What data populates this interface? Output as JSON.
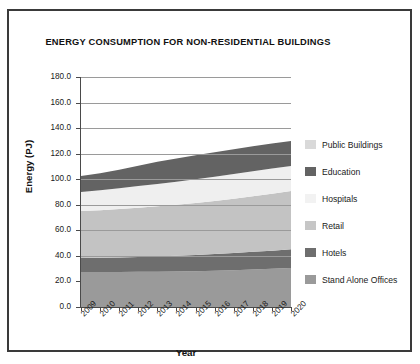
{
  "chart_data": {
    "type": "area",
    "title": "ENERGY CONSUMPTION FOR NON-RESIDENTIAL BUILDINGS",
    "xlabel": "Year",
    "ylabel": "Energy (PJ)",
    "stacked": true,
    "grid": true,
    "legend_position": "right",
    "categories": [
      "2009",
      "2010",
      "2011",
      "2012",
      "2013",
      "2014",
      "2015",
      "2016",
      "2017",
      "2018",
      "2019",
      "2020"
    ],
    "x": [
      2009,
      2010,
      2011,
      2012,
      2013,
      2014,
      2015,
      2016,
      2017,
      2018,
      2019,
      2020
    ],
    "ylim": [
      0,
      180
    ],
    "ytick_labels": [
      "0.0",
      "20.0",
      "40.0",
      "60.0",
      "80.0",
      "100.0",
      "120.0",
      "140.0",
      "160.0",
      "180.0"
    ],
    "ytick_values": [
      0,
      20,
      40,
      60,
      80,
      100,
      120,
      140,
      160,
      180
    ],
    "series": [
      {
        "name": "Stand Alone Offices",
        "color": "#9a9a9a",
        "values": [
          27.4,
          27.4,
          27.4,
          27.5,
          27.6,
          27.8,
          28.0,
          28.4,
          28.8,
          29.4,
          29.9,
          30.5
        ]
      },
      {
        "name": "Hotels",
        "color": "#6e6e6e",
        "values": [
          10.9,
          11.1,
          11.4,
          11.7,
          12.0,
          12.3,
          12.6,
          13.0,
          13.4,
          13.8,
          14.2,
          14.6
        ]
      },
      {
        "name": "Retail",
        "color": "#c3c3c3",
        "values": [
          36.8,
          37.3,
          37.9,
          38.5,
          39.2,
          39.9,
          40.7,
          41.6,
          42.5,
          43.5,
          44.6,
          45.6
        ]
      },
      {
        "name": "Hospitals",
        "color": "#efefef",
        "values": [
          14.9,
          15.5,
          16.2,
          16.9,
          17.5,
          18.1,
          18.6,
          19.0,
          19.3,
          19.5,
          19.6,
          19.6
        ]
      },
      {
        "name": "Education",
        "color": "#636363",
        "values": [
          12.5,
          13.3,
          14.5,
          16.0,
          17.3,
          18.2,
          18.8,
          19.2,
          19.5,
          19.6,
          19.7,
          19.7
        ]
      },
      {
        "name": "Public Buildings",
        "color": "#d7d7d7",
        "values": [
          0.0,
          0.0,
          0.0,
          0.0,
          0.0,
          0.0,
          0.0,
          0.0,
          0.0,
          0.0,
          0.0,
          0.0
        ]
      }
    ],
    "series_totals": [
      102.5,
      104.6,
      107.4,
      110.6,
      113.6,
      116.3,
      118.7,
      121.2,
      123.5,
      125.8,
      128.0,
      130.0
    ],
    "stack_order_bottom_to_top": [
      "Stand Alone Offices",
      "Hotels",
      "Retail",
      "Hospitals",
      "Education"
    ],
    "totals": {
      "2009": 102.5,
      "2020": 130.0
    }
  },
  "legend": {
    "items": [
      {
        "label": "Public Buildings",
        "color": "#d9d9d9"
      },
      {
        "label": "Education",
        "color": "#636363"
      },
      {
        "label": "Hospitals",
        "color": "#f2f2f2"
      },
      {
        "label": "Retail",
        "color": "#c6c6c6"
      },
      {
        "label": "Hotels",
        "color": "#6e6e6e"
      },
      {
        "label": "Stand Alone Offices",
        "color": "#9a9a9a"
      }
    ]
  },
  "colors": {
    "background": "#ffffff",
    "border": "#3a3a3a",
    "axis": "#4a4a4a",
    "grid": "#9a9a9a",
    "text": "#1a1a1a"
  }
}
